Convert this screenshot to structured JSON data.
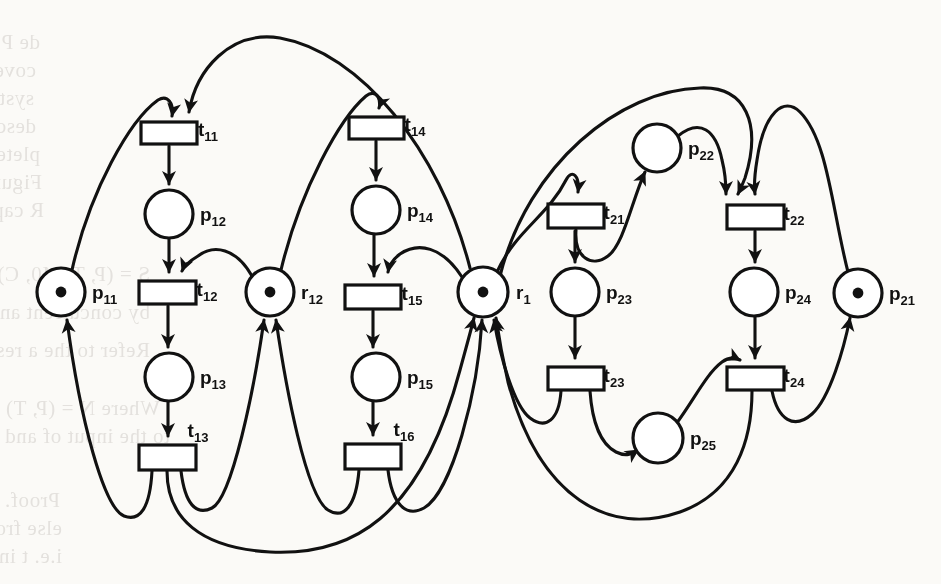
{
  "figure": {
    "kind": "petri-net-diagram",
    "caption": "",
    "background_color": "#fbfaf7",
    "ink_color": "#111111"
  },
  "places": [
    {
      "id": "p11",
      "base": "p",
      "sub": "11",
      "cx": 61,
      "cy": 292,
      "r": 24,
      "tokens": 1,
      "label_x": 92,
      "label_y": 299
    },
    {
      "id": "p12",
      "base": "p",
      "sub": "12",
      "cx": 169,
      "cy": 214,
      "r": 24,
      "tokens": 0,
      "label_x": 200,
      "label_y": 221
    },
    {
      "id": "p13",
      "base": "p",
      "sub": "13",
      "cx": 169,
      "cy": 377,
      "r": 24,
      "tokens": 0,
      "label_x": 200,
      "label_y": 384
    },
    {
      "id": "r12",
      "base": "r",
      "sub": "12",
      "cx": 270,
      "cy": 292,
      "r": 24,
      "tokens": 1,
      "label_x": 301,
      "label_y": 299
    },
    {
      "id": "p14",
      "base": "p",
      "sub": "14",
      "cx": 376,
      "cy": 210,
      "r": 24,
      "tokens": 0,
      "label_x": 407,
      "label_y": 217
    },
    {
      "id": "p15",
      "base": "p",
      "sub": "15",
      "cx": 376,
      "cy": 377,
      "r": 24,
      "tokens": 0,
      "label_x": 407,
      "label_y": 384
    },
    {
      "id": "r1",
      "base": "r",
      "sub": "1",
      "cx": 483,
      "cy": 292,
      "r": 25,
      "tokens": 1,
      "label_x": 516,
      "label_y": 299
    },
    {
      "id": "p22",
      "base": "p",
      "sub": "22",
      "cx": 657,
      "cy": 148,
      "r": 24,
      "tokens": 0,
      "label_x": 688,
      "label_y": 155
    },
    {
      "id": "p23",
      "base": "p",
      "sub": "23",
      "cx": 575,
      "cy": 292,
      "r": 24,
      "tokens": 0,
      "label_x": 606,
      "label_y": 299
    },
    {
      "id": "p24",
      "base": "p",
      "sub": "24",
      "cx": 754,
      "cy": 292,
      "r": 24,
      "tokens": 0,
      "label_x": 785,
      "label_y": 299
    },
    {
      "id": "p25",
      "base": "p",
      "sub": "25",
      "cx": 658,
      "cy": 438,
      "r": 25,
      "tokens": 0,
      "label_x": 690,
      "label_y": 445
    },
    {
      "id": "p21",
      "base": "p",
      "sub": "21",
      "cx": 858,
      "cy": 293,
      "r": 24,
      "tokens": 1,
      "label_x": 889,
      "label_y": 300
    }
  ],
  "transitions": [
    {
      "id": "t11",
      "base": "t",
      "sub": "11",
      "x": 141,
      "y": 122,
      "w": 56,
      "h": 22,
      "label_x": 208,
      "label_y": 136
    },
    {
      "id": "t12",
      "base": "t",
      "sub": "12",
      "x": 139,
      "y": 281,
      "w": 57,
      "h": 23,
      "label_x": 207,
      "label_y": 296
    },
    {
      "id": "t13",
      "base": "t",
      "sub": "13",
      "x": 139,
      "y": 445,
      "w": 57,
      "h": 25,
      "label_x": 198,
      "label_y": 437
    },
    {
      "id": "t14",
      "base": "t",
      "sub": "14",
      "x": 349,
      "y": 117,
      "w": 55,
      "h": 22,
      "label_x": 415,
      "label_y": 131
    },
    {
      "id": "t15",
      "base": "t",
      "sub": "15",
      "x": 345,
      "y": 285,
      "w": 56,
      "h": 24,
      "label_x": 412,
      "label_y": 300
    },
    {
      "id": "t16",
      "base": "t",
      "sub": "16",
      "x": 345,
      "y": 444,
      "w": 56,
      "h": 25,
      "label_x": 404,
      "label_y": 436
    },
    {
      "id": "t21",
      "base": "t",
      "sub": "21",
      "x": 548,
      "y": 204,
      "w": 56,
      "h": 24,
      "label_x": 614,
      "label_y": 219
    },
    {
      "id": "t22",
      "base": "t",
      "sub": "22",
      "x": 727,
      "y": 205,
      "w": 57,
      "h": 24,
      "label_x": 794,
      "label_y": 220
    },
    {
      "id": "t23",
      "base": "t",
      "sub": "23",
      "x": 548,
      "y": 367,
      "w": 56,
      "h": 23,
      "label_x": 614,
      "label_y": 382
    },
    {
      "id": "t24",
      "base": "t",
      "sub": "24",
      "x": 727,
      "y": 367,
      "w": 57,
      "h": 23,
      "label_x": 794,
      "label_y": 382
    }
  ],
  "ghost_text": [
    {
      "text": "de Peripheral in an integrated an introd",
      "x": 40,
      "y": 30
    },
    {
      "text": "covers and definition can hardly give",
      "x": 36,
      "y": 58
    },
    {
      "text": "systems considering based on is applied",
      "x": 34,
      "y": 86
    },
    {
      "text": "describing an analyzed discrete the com",
      "x": 36,
      "y": 114
    },
    {
      "text": "plete the is a place-transition a resource",
      "x": 40,
      "y": 142
    },
    {
      "text": "Figure 4 models the involving of a two",
      "x": 42,
      "y": 170
    },
    {
      "text": "R captures and the cyclic in the same",
      "x": 44,
      "y": 198
    },
    {
      "text": "S = (P, T, M0, C) be a Petri net",
      "x": 150,
      "y": 262
    },
    {
      "text": "by concurrent an algorithm shown",
      "x": 150,
      "y": 300
    },
    {
      "text": "Refer to the a resource place from",
      "x": 150,
      "y": 338
    },
    {
      "text": "Where N = (P, T) and a marking",
      "x": 160,
      "y": 396
    },
    {
      "text": "to the input of and a structural",
      "x": 170,
      "y": 424
    },
    {
      "text": "Proof. Suppose is covered by the S = (P, T, M0, C)",
      "x": 60,
      "y": 488
    },
    {
      "text": "else from the elementary circuit R, which identifies",
      "x": 62,
      "y": 516
    },
    {
      "text": "i.e. t in the net is the trivial case, corresponding to P",
      "x": 62,
      "y": 544
    }
  ]
}
